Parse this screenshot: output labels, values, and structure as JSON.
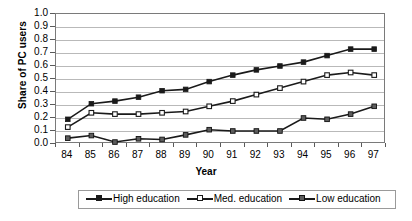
{
  "chart_data": {
    "type": "line",
    "title": "",
    "xlabel": "Year",
    "ylabel": "Share of PC users",
    "categories": [
      "84",
      "85",
      "86",
      "87",
      "88",
      "89",
      "90",
      "91",
      "92",
      "93",
      "94",
      "95",
      "96",
      "97"
    ],
    "x": [
      84,
      85,
      86,
      87,
      88,
      89,
      90,
      91,
      92,
      93,
      94,
      95,
      96,
      97
    ],
    "ylim": [
      0.0,
      1.0
    ],
    "ytick_labels": [
      "1.0",
      "0.9",
      "0.8",
      "0.7",
      "0.6",
      "0.5",
      "0.4",
      "0.3",
      "0.2",
      "0.1",
      "0.0"
    ],
    "ytick_values": [
      1.0,
      0.9,
      0.8,
      0.7,
      0.6,
      0.5,
      0.4,
      0.3,
      0.2,
      0.1,
      0.0
    ],
    "grid": true,
    "grid_axis": "y",
    "legend_position": "bottom",
    "series": [
      {
        "name": "High education",
        "marker": "square-filled",
        "color": "#1a1a1a",
        "values": [
          0.19,
          0.31,
          0.33,
          0.36,
          0.41,
          0.42,
          0.48,
          0.53,
          0.57,
          0.6,
          0.63,
          0.68,
          0.73,
          0.73
        ]
      },
      {
        "name": "Med. education",
        "marker": "square-open",
        "color": "#1a1a1a",
        "values": [
          0.13,
          0.24,
          0.23,
          0.23,
          0.24,
          0.25,
          0.29,
          0.33,
          0.38,
          0.43,
          0.48,
          0.53,
          0.55,
          0.53
        ]
      },
      {
        "name": "Low education",
        "marker": "square-filled-gray",
        "color": "#1a1a1a",
        "values": [
          0.045,
          0.065,
          0.015,
          0.04,
          0.035,
          0.07,
          0.11,
          0.1,
          0.1,
          0.1,
          0.2,
          0.19,
          0.23,
          0.29
        ]
      }
    ]
  }
}
